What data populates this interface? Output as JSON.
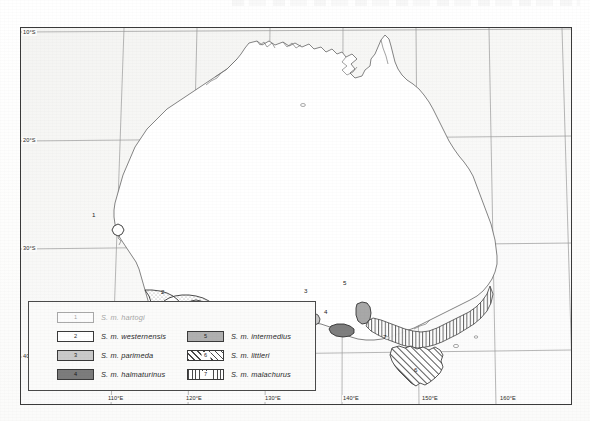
{
  "map": {
    "title": "Distribution map of Australia",
    "frame": {
      "x": 20,
      "y": 27,
      "width": 552,
      "height": 378
    },
    "projection_note": "Australia with graticule",
    "graticule": {
      "latitude_labels": [
        {
          "text": "10°S",
          "y": 30
        },
        {
          "text": "20°S",
          "y": 139
        },
        {
          "text": "30°S",
          "y": 247
        },
        {
          "text": "40°S",
          "y": 355
        }
      ],
      "longitude_labels": [
        {
          "text": "110°E",
          "x": 106
        },
        {
          "text": "120°E",
          "x": 184
        },
        {
          "text": "130°E",
          "x": 263
        },
        {
          "text": "140°E",
          "x": 341
        },
        {
          "text": "150°E",
          "x": 420
        },
        {
          "text": "160°E",
          "x": 498
        }
      ]
    },
    "region_markers": [
      {
        "id": "1",
        "x": 93,
        "y": 213
      },
      {
        "id": "2",
        "x": 160,
        "y": 290
      },
      {
        "id": "3",
        "x": 305,
        "y": 291
      },
      {
        "id": "4",
        "x": 325,
        "y": 309
      },
      {
        "id": "5",
        "x": 343,
        "y": 283
      },
      {
        "id": "6",
        "x": 413,
        "y": 369
      },
      {
        "id": "7",
        "x": 383,
        "y": 336
      }
    ]
  },
  "legend": {
    "entries_left": [
      {
        "number": "1",
        "name": "S. m. hartogi",
        "fill": "white",
        "faded": true
      },
      {
        "number": "2",
        "name": "S. m. westernensis",
        "fill": "dotted",
        "faded": false
      },
      {
        "number": "3",
        "name": "S. m. parimeda",
        "fill": "light-gray",
        "faded": false
      },
      {
        "number": "4",
        "name": "S. m. halmaturinus",
        "fill": "dark-gray",
        "faded": false
      }
    ],
    "entries_right": [
      {
        "number": "5",
        "name": "S. m. intermedius",
        "fill": "medium-gray",
        "faded": false
      },
      {
        "number": "6",
        "name": "S. m. littleri",
        "fill": "diagonal-hatch",
        "faded": false
      },
      {
        "number": "7",
        "name": "S. m. malachurus",
        "fill": "vertical-hatch",
        "faded": false
      }
    ]
  },
  "colors": {
    "frame_border": "#3b3b3b",
    "coastline": "#6b6b6b",
    "graticule": "#8e8e8e",
    "ocean_tint": "#f2f2f0",
    "land": "#ffffff",
    "swatch_light_gray": "#c9c9c9",
    "swatch_medium_gray": "#b0b0b0",
    "swatch_dark_gray": "#7c7c7c",
    "hatch": "#4a4a4a",
    "text": "#2a2a2a"
  }
}
